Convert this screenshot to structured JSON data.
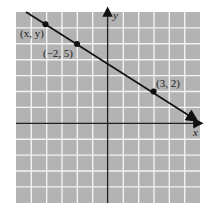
{
  "diagram": {
    "type": "coordinate-plane-line",
    "grid": {
      "x_min": -6,
      "x_max": 6,
      "y_min": -5,
      "y_max": 7,
      "background": "#b3b3b3",
      "line_color": "#ffffff"
    },
    "axes": {
      "x_label": "x",
      "y_label": "y"
    },
    "line": {
      "slope": -0.6,
      "description": "Line through (-2, 5) and (3, 2)",
      "color": "#111111"
    },
    "points": [
      {
        "label": "(x, y)",
        "x": -4,
        "y": 6.2
      },
      {
        "label": "(−2, 5)",
        "x": -2,
        "y": 5
      },
      {
        "label": "(3, 2)",
        "x": 3,
        "y": 2
      }
    ]
  }
}
